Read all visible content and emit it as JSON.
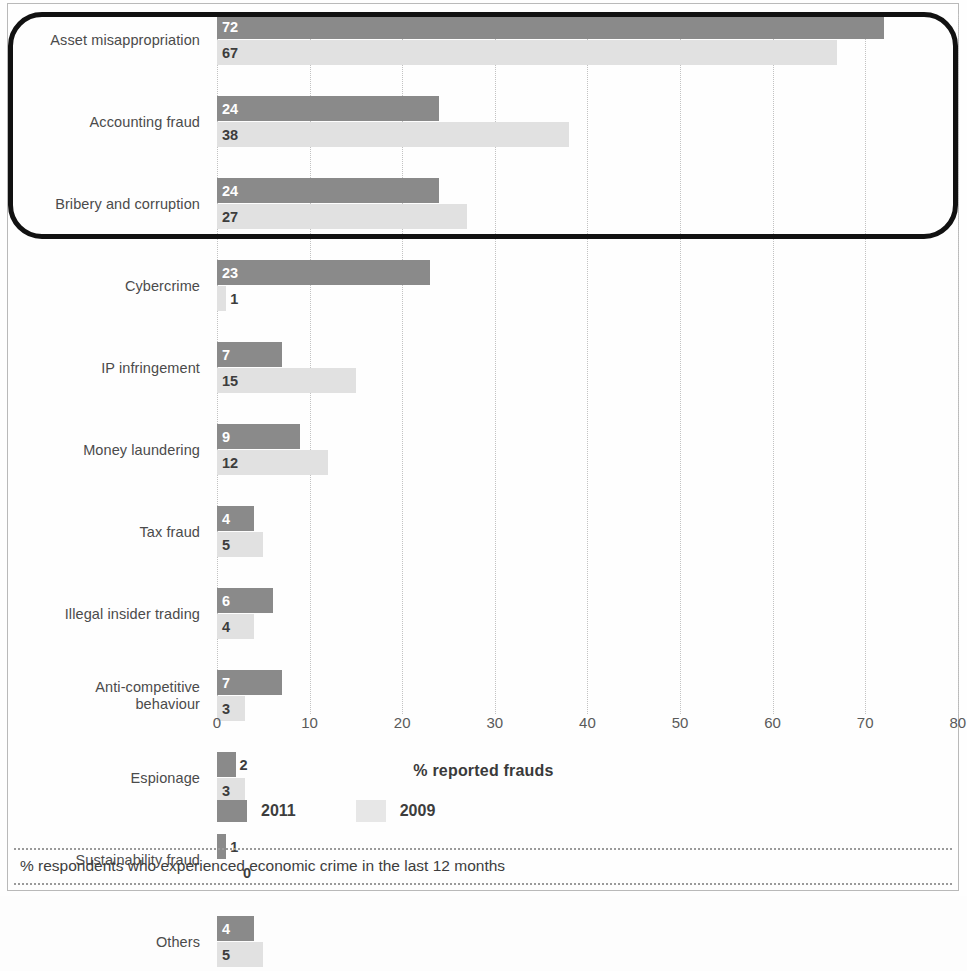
{
  "chart_data": {
    "type": "bar",
    "orientation": "horizontal",
    "title": "",
    "xlabel": "% reported frauds",
    "ylabel": "",
    "xlim": [
      0,
      80
    ],
    "xticks": [
      "0",
      "10",
      "20",
      "30",
      "40",
      "50",
      "60",
      "70",
      "80"
    ],
    "grid": "vertical dotted gridlines at each x tick",
    "legend_position": "bottom-left",
    "categories": [
      "Asset misappropriation",
      "Accounting fraud",
      "Bribery and corruption",
      "Cybercrime",
      "IP infringement",
      "Money laundering",
      "Tax fraud",
      "Illegal insider trading",
      "Anti-competitive behaviour",
      "Espionage",
      "Sustainability fraud",
      "Others"
    ],
    "series": [
      {
        "name": "2011",
        "color": "#8a8a8a",
        "values": [
          72,
          24,
          24,
          23,
          7,
          9,
          4,
          6,
          7,
          2,
          1,
          4
        ]
      },
      {
        "name": "2009",
        "color": "#e1e1e1",
        "values": [
          67,
          38,
          27,
          1,
          15,
          12,
          5,
          4,
          3,
          3,
          0,
          5
        ]
      }
    ]
  },
  "rows": [
    {
      "label": "Asset misappropriation",
      "label2": "",
      "v2011": "72",
      "v2009": "67"
    },
    {
      "label": "Accounting fraud",
      "label2": "",
      "v2011": "24",
      "v2009": "38"
    },
    {
      "label": "Bribery and corruption",
      "label2": "",
      "v2011": "24",
      "v2009": "27"
    },
    {
      "label": "Cybercrime",
      "label2": "",
      "v2011": "23",
      "v2009": "1"
    },
    {
      "label": "IP infringement",
      "label2": "",
      "v2011": "7",
      "v2009": "15"
    },
    {
      "label": "Money laundering",
      "label2": "",
      "v2011": "9",
      "v2009": "12"
    },
    {
      "label": "Tax fraud",
      "label2": "",
      "v2011": "4",
      "v2009": "5"
    },
    {
      "label": "Illegal insider trading",
      "label2": "",
      "v2011": "6",
      "v2009": "4"
    },
    {
      "label": "Anti-competitive",
      "label2": "behaviour",
      "v2011": "7",
      "v2009": "3"
    },
    {
      "label": "Espionage",
      "label2": "",
      "v2011": "2",
      "v2009": "3"
    },
    {
      "label": "Sustainability fraud",
      "label2": "",
      "v2011": "1",
      "v2009": "0"
    },
    {
      "label": "Others",
      "label2": "",
      "v2011": "4",
      "v2009": "5"
    }
  ],
  "axis": {
    "title": "% reported frauds",
    "ticks": [
      "0",
      "10",
      "20",
      "30",
      "40",
      "50",
      "60",
      "70",
      "80"
    ]
  },
  "legend": {
    "items": [
      {
        "label": "2011",
        "color": "#8a8a8a"
      },
      {
        "label": "2009",
        "color": "#e7e7e7"
      }
    ]
  },
  "footnote": {
    "text": "% respondents who experienced economic crime in the last 12 months"
  }
}
